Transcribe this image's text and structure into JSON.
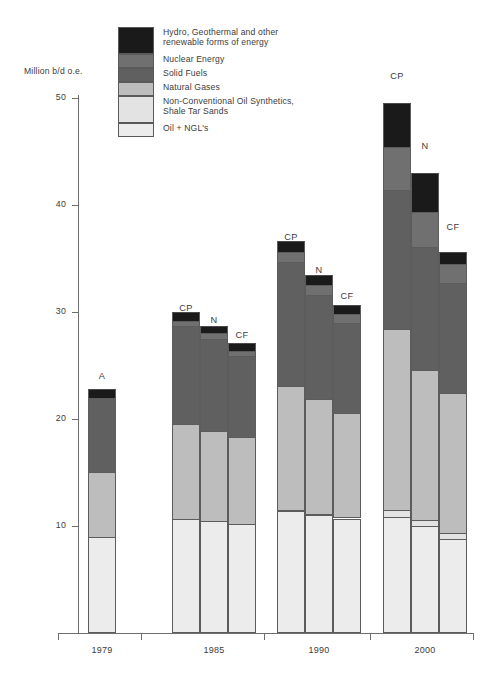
{
  "axis": {
    "y_title": "Million b/d o.e.",
    "y_ticks": [
      "50",
      "40",
      "30",
      "20",
      "10"
    ],
    "x_categories": [
      "1979",
      "1985",
      "1990",
      "2000"
    ]
  },
  "legend": {
    "items": [
      {
        "label": "Hydro, Geothermal and other\nrenewable forms of energy",
        "color": "#1a1a1a",
        "tall": true
      },
      {
        "label": "Nuclear Energy",
        "color": "#707070",
        "tall": false
      },
      {
        "label": "Solid Fuels",
        "color": "#606060",
        "tall": false
      },
      {
        "label": "Natural Gases",
        "color": "#bdbdbd",
        "tall": false
      },
      {
        "label": "Non-Conventional Oil Synthetics,\nShale Tar Sands",
        "color": "#e3e3e3",
        "tall": true
      },
      {
        "label": "Oil + NGL's",
        "color": "#ececec",
        "tall": false
      }
    ]
  },
  "chart_data": {
    "type": "bar",
    "subtype": "stacked-grouped",
    "title": "",
    "xlabel": "",
    "ylabel": "Million b/d o.e.",
    "ylim": [
      0,
      50
    ],
    "yticks": [
      10,
      20,
      30,
      40,
      50
    ],
    "grid": false,
    "legend_position": "top-left",
    "categories": [
      "1979",
      "1985",
      "1990",
      "2000"
    ],
    "scenarios": [
      "A",
      "CP",
      "N",
      "CF"
    ],
    "series": [
      {
        "name": "Oil + NGL's",
        "color": "#ececec",
        "values": {
          "1979": [
            9.0
          ],
          "1985": [
            10.7,
            10.5,
            10.2
          ],
          "1990": [
            11.4,
            11.0,
            10.7
          ],
          "2000": [
            10.8,
            10.0,
            8.8
          ]
        }
      },
      {
        "name": "Non-Conventional Oil Synthetics, Shale Tar Sands",
        "color": "#e3e3e3",
        "values": {
          "1979": [
            0.0
          ],
          "1985": [
            0.0,
            0.0,
            0.0
          ],
          "1990": [
            0.1,
            0.1,
            0.1
          ],
          "2000": [
            0.7,
            0.6,
            0.5
          ]
        }
      },
      {
        "name": "Natural Gases",
        "color": "#bdbdbd",
        "values": {
          "1979": [
            6.0
          ],
          "1985": [
            8.8,
            8.4,
            8.1
          ],
          "1990": [
            11.6,
            10.8,
            9.8
          ],
          "2000": [
            16.9,
            14.0,
            13.1
          ]
        }
      },
      {
        "name": "Solid Fuels",
        "color": "#606060",
        "values": {
          "1979": [
            7.0
          ],
          "1985": [
            9.2,
            8.6,
            7.6
          ],
          "1990": [
            11.6,
            9.7,
            8.4
          ],
          "2000": [
            13.0,
            11.5,
            10.3
          ]
        }
      },
      {
        "name": "Nuclear Energy",
        "color": "#707070",
        "values": {
          "1979": [
            0.0
          ],
          "1985": [
            0.5,
            0.5,
            0.5
          ],
          "1990": [
            0.9,
            0.9,
            0.8
          ],
          "2000": [
            4.0,
            3.2,
            1.8
          ]
        }
      },
      {
        "name": "Hydro, Geothermal and other renewable forms of energy",
        "color": "#1a1a1a",
        "values": {
          "1979": [
            0.8
          ],
          "1985": [
            0.8,
            0.7,
            0.7
          ],
          "1990": [
            1.0,
            1.0,
            0.9
          ],
          "2000": [
            4.1,
            3.7,
            1.1
          ]
        }
      }
    ],
    "totals": {
      "1979": [
        22.8
      ],
      "1985": [
        30.0,
        28.7,
        27.1
      ],
      "1990": [
        36.6,
        33.5,
        30.7
      ],
      "2000": [
        49.5,
        43.0,
        35.6
      ]
    }
  },
  "bars": [
    {
      "group": "1979",
      "tag": "A",
      "left": 88,
      "width": 28,
      "tag_top": 371,
      "segments": [
        {
          "name": "oil-ngl",
          "color": "#ececec",
          "from": 0.0,
          "to": 9.0
        },
        {
          "name": "natural-gases",
          "color": "#bdbdbd",
          "from": 9.0,
          "to": 15.0
        },
        {
          "name": "solid-fuels",
          "color": "#606060",
          "from": 15.0,
          "to": 22.0
        },
        {
          "name": "hydro-renewables",
          "color": "#1a1a1a",
          "from": 22.0,
          "to": 22.8
        }
      ]
    },
    {
      "group": "1985",
      "tag": "CP",
      "left": 172,
      "width": 28,
      "tag_top": 303,
      "segments": [
        {
          "name": "oil-ngl",
          "color": "#ececec",
          "from": 0.0,
          "to": 10.7
        },
        {
          "name": "natural-gases",
          "color": "#bdbdbd",
          "from": 10.7,
          "to": 19.5
        },
        {
          "name": "solid-fuels",
          "color": "#606060",
          "from": 19.5,
          "to": 28.7
        },
        {
          "name": "nuclear",
          "color": "#707070",
          "from": 28.7,
          "to": 29.2
        },
        {
          "name": "hydro-renewables",
          "color": "#1a1a1a",
          "from": 29.2,
          "to": 30.0
        }
      ]
    },
    {
      "group": "1985",
      "tag": "N",
      "left": 200,
      "width": 28,
      "tag_top": 315,
      "segments": [
        {
          "name": "oil-ngl",
          "color": "#ececec",
          "from": 0.0,
          "to": 10.5
        },
        {
          "name": "natural-gases",
          "color": "#bdbdbd",
          "from": 10.5,
          "to": 18.9
        },
        {
          "name": "solid-fuels",
          "color": "#606060",
          "from": 18.9,
          "to": 27.5
        },
        {
          "name": "nuclear",
          "color": "#707070",
          "from": 27.5,
          "to": 28.0
        },
        {
          "name": "hydro-renewables",
          "color": "#1a1a1a",
          "from": 28.0,
          "to": 28.7
        }
      ]
    },
    {
      "group": "1985",
      "tag": "CF",
      "left": 228,
      "width": 28,
      "tag_top": 330,
      "segments": [
        {
          "name": "oil-ngl",
          "color": "#ececec",
          "from": 0.0,
          "to": 10.2
        },
        {
          "name": "natural-gases",
          "color": "#bdbdbd",
          "from": 10.2,
          "to": 18.3
        },
        {
          "name": "solid-fuels",
          "color": "#606060",
          "from": 18.3,
          "to": 25.9
        },
        {
          "name": "nuclear",
          "color": "#707070",
          "from": 25.9,
          "to": 26.4
        },
        {
          "name": "hydro-renewables",
          "color": "#1a1a1a",
          "from": 26.4,
          "to": 27.1
        }
      ]
    },
    {
      "group": "1990",
      "tag": "CP",
      "left": 277,
      "width": 28,
      "tag_top": 232,
      "segments": [
        {
          "name": "oil-ngl",
          "color": "#ececec",
          "from": 0.0,
          "to": 11.4
        },
        {
          "name": "non-conventional",
          "color": "#e3e3e3",
          "from": 11.4,
          "to": 11.5
        },
        {
          "name": "natural-gases",
          "color": "#bdbdbd",
          "from": 11.5,
          "to": 23.1
        },
        {
          "name": "solid-fuels",
          "color": "#606060",
          "from": 23.1,
          "to": 34.7
        },
        {
          "name": "nuclear",
          "color": "#707070",
          "from": 34.7,
          "to": 35.6
        },
        {
          "name": "hydro-renewables",
          "color": "#1a1a1a",
          "from": 35.6,
          "to": 36.6
        }
      ]
    },
    {
      "group": "1990",
      "tag": "N",
      "left": 305,
      "width": 28,
      "tag_top": 265,
      "segments": [
        {
          "name": "oil-ngl",
          "color": "#ececec",
          "from": 0.0,
          "to": 11.0
        },
        {
          "name": "non-conventional",
          "color": "#e3e3e3",
          "from": 11.0,
          "to": 11.1
        },
        {
          "name": "natural-gases",
          "color": "#bdbdbd",
          "from": 11.1,
          "to": 21.9
        },
        {
          "name": "solid-fuels",
          "color": "#606060",
          "from": 21.9,
          "to": 31.6
        },
        {
          "name": "nuclear",
          "color": "#707070",
          "from": 31.6,
          "to": 32.5
        },
        {
          "name": "hydro-renewables",
          "color": "#1a1a1a",
          "from": 32.5,
          "to": 33.5
        }
      ]
    },
    {
      "group": "1990",
      "tag": "CF",
      "left": 333,
      "width": 28,
      "tag_top": 291,
      "segments": [
        {
          "name": "oil-ngl",
          "color": "#ececec",
          "from": 0.0,
          "to": 10.7
        },
        {
          "name": "non-conventional",
          "color": "#e3e3e3",
          "from": 10.7,
          "to": 10.8
        },
        {
          "name": "natural-gases",
          "color": "#bdbdbd",
          "from": 10.8,
          "to": 20.6
        },
        {
          "name": "solid-fuels",
          "color": "#606060",
          "from": 20.6,
          "to": 29.0
        },
        {
          "name": "nuclear",
          "color": "#707070",
          "from": 29.0,
          "to": 29.8
        },
        {
          "name": "hydro-renewables",
          "color": "#1a1a1a",
          "from": 29.8,
          "to": 30.7
        }
      ]
    },
    {
      "group": "2000",
      "tag": "CP",
      "left": 383,
      "width": 28,
      "tag_top": 71,
      "segments": [
        {
          "name": "oil-ngl",
          "color": "#ececec",
          "from": 0.0,
          "to": 10.8
        },
        {
          "name": "non-conventional",
          "color": "#e3e3e3",
          "from": 10.8,
          "to": 11.5
        },
        {
          "name": "natural-gases",
          "color": "#bdbdbd",
          "from": 11.5,
          "to": 28.4
        },
        {
          "name": "solid-fuels",
          "color": "#606060",
          "from": 28.4,
          "to": 41.4
        },
        {
          "name": "nuclear",
          "color": "#707070",
          "from": 41.4,
          "to": 45.4
        },
        {
          "name": "hydro-renewables",
          "color": "#1a1a1a",
          "from": 45.4,
          "to": 49.5
        }
      ]
    },
    {
      "group": "2000",
      "tag": "N",
      "left": 411,
      "width": 28,
      "tag_top": 141,
      "segments": [
        {
          "name": "oil-ngl",
          "color": "#ececec",
          "from": 0.0,
          "to": 10.0
        },
        {
          "name": "non-conventional",
          "color": "#e3e3e3",
          "from": 10.0,
          "to": 10.6
        },
        {
          "name": "natural-gases",
          "color": "#bdbdbd",
          "from": 10.6,
          "to": 24.6
        },
        {
          "name": "solid-fuels",
          "color": "#606060",
          "from": 24.6,
          "to": 36.1
        },
        {
          "name": "nuclear",
          "color": "#707070",
          "from": 36.1,
          "to": 39.3
        },
        {
          "name": "hydro-renewables",
          "color": "#1a1a1a",
          "from": 39.3,
          "to": 43.0
        }
      ]
    },
    {
      "group": "2000",
      "tag": "CF",
      "left": 439,
      "width": 28,
      "tag_top": 222,
      "segments": [
        {
          "name": "oil-ngl",
          "color": "#ececec",
          "from": 0.0,
          "to": 8.8
        },
        {
          "name": "non-conventional",
          "color": "#e3e3e3",
          "from": 8.8,
          "to": 9.3
        },
        {
          "name": "natural-gases",
          "color": "#bdbdbd",
          "from": 9.3,
          "to": 22.4
        },
        {
          "name": "solid-fuels",
          "color": "#606060",
          "from": 22.4,
          "to": 32.7
        },
        {
          "name": "nuclear",
          "color": "#707070",
          "from": 32.7,
          "to": 34.5
        },
        {
          "name": "hydro-renewables",
          "color": "#1a1a1a",
          "from": 34.5,
          "to": 35.6
        }
      ]
    }
  ],
  "group_positions": [
    {
      "label": "1979",
      "center": 102,
      "tick_left": 141
    },
    {
      "label": "1985",
      "center": 214,
      "tick_left": 264
    },
    {
      "label": "1990",
      "center": 319,
      "tick_left": 370
    },
    {
      "label": "2000",
      "center": 425,
      "tick_left": 473
    }
  ]
}
